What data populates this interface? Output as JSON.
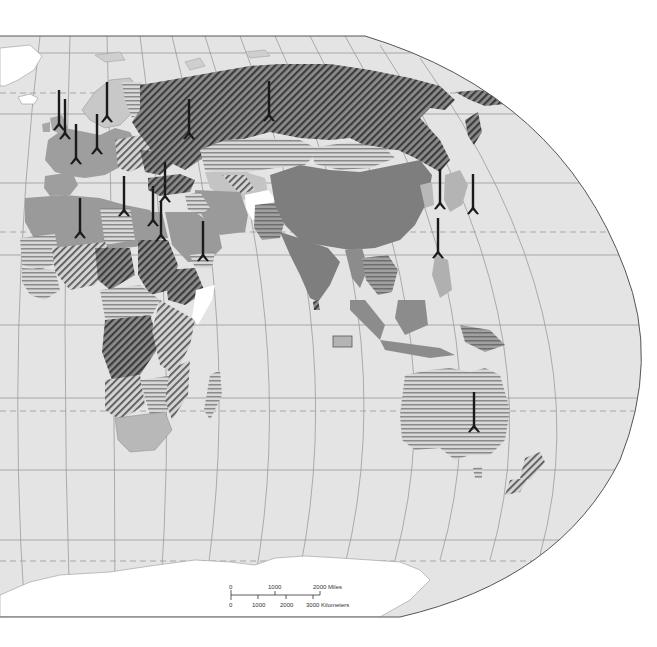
{
  "map": {
    "projection": "Eastern Hemisphere world map, curved graticule",
    "colors": {
      "ocean": "#e4e4e4",
      "land_light": "#d2d2d2",
      "land_medium": "#a9a9a9",
      "land_dark": "#8a8a8a",
      "ice_white": "#ffffff",
      "graticule": "#8f8f8f",
      "border": "#555555",
      "missile": "#1a1a1a",
      "hatch_dark": "#444444"
    },
    "patterns": [
      {
        "id": "diag-dark",
        "name": "dark diagonal hatch"
      },
      {
        "id": "diag-light",
        "name": "light diagonal hatch"
      },
      {
        "id": "horiz",
        "name": "horizontal stripes"
      },
      {
        "id": "solid-medium",
        "name": "solid medium gray"
      },
      {
        "id": "solid-light",
        "name": "solid light gray"
      },
      {
        "id": "white",
        "name": "white"
      }
    ],
    "missile_symbols_count": 18,
    "indian_ocean_marker": "small gray rectangle"
  },
  "scale_bar": {
    "miles_labels": [
      "0",
      "1000",
      "2000 Miles"
    ],
    "km_labels": [
      "0",
      "1000",
      "2000",
      "3000 Kilometers"
    ]
  }
}
